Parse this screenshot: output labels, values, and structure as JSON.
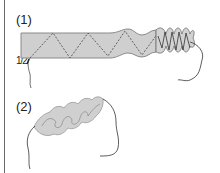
{
  "figure": {
    "steps": [
      {
        "label": "(1)",
        "description": "ribbon with zigzag running stitch being gathered"
      },
      {
        "label": "(2)",
        "description": "fully gathered ribbon forming ruffled petals"
      }
    ],
    "measurement_label": "1/2",
    "colors": {
      "ribbon_fill": "#cfcfcf",
      "ribbon_edge": "#8a8a8a",
      "stitch": "#555555",
      "thread": "#333333",
      "border": "#6a6a6a"
    }
  }
}
